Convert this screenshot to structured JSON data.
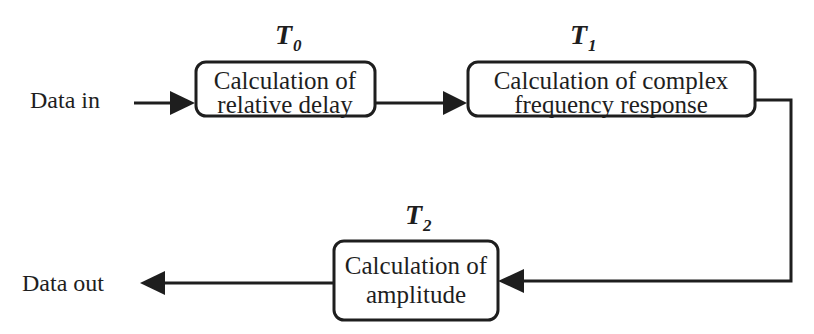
{
  "diagram": {
    "input_label": "Data in",
    "output_label": "Data out",
    "blocks": [
      {
        "id": "relative-delay",
        "stage": "T",
        "stage_sub": "0",
        "lines": [
          "Calculation of",
          "relative delay"
        ]
      },
      {
        "id": "complex-frequency-response",
        "stage": "T",
        "stage_sub": "1",
        "lines": [
          "Calculation of complex",
          "frequency response"
        ]
      },
      {
        "id": "amplitude",
        "stage": "T",
        "stage_sub": "2",
        "lines": [
          "Calculation of",
          "amplitude"
        ]
      }
    ],
    "connections": [
      {
        "from": "input",
        "to": "relative-delay"
      },
      {
        "from": "relative-delay",
        "to": "complex-frequency-response"
      },
      {
        "from": "complex-frequency-response",
        "to": "amplitude"
      },
      {
        "from": "amplitude",
        "to": "output"
      }
    ],
    "colors": {
      "stroke": "#1e1e1e",
      "background": "#ffffff"
    }
  }
}
